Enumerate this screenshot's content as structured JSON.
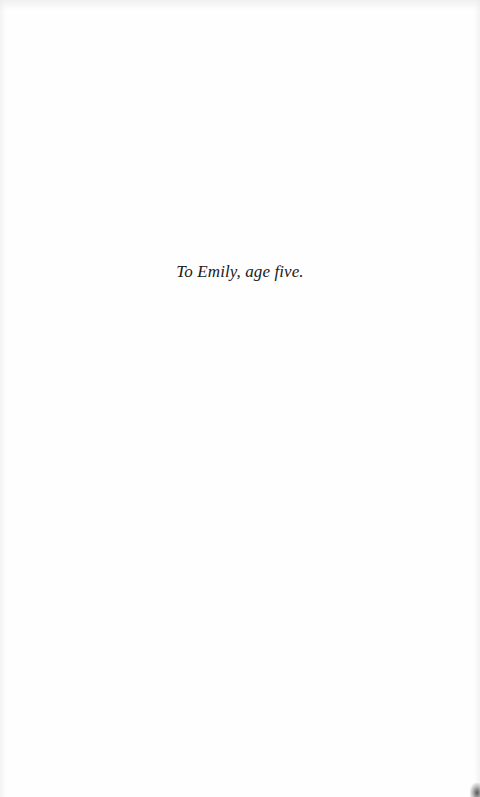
{
  "page": {
    "dedication": "To Emily, age five."
  },
  "colors": {
    "background": "#fefefe",
    "text": "#1a1a1a"
  }
}
